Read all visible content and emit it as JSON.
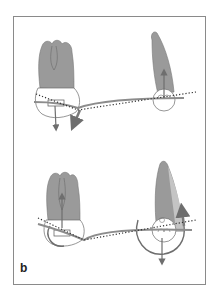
{
  "figure": {
    "panel_label": "b",
    "colors": {
      "tooth": "#9a9a9a",
      "tooth_light": "#c4c4c4",
      "outline": "#6a6a6a",
      "arrow": "#7a7a7a",
      "wire": "#8c8c8c",
      "dotted": "#333333",
      "frame": "#8a8a8a"
    },
    "top_panel": {
      "description": "Molar and canine with archwire, force arrows and dotted reference line",
      "left_tooth": "molar",
      "right_tooth": "canine",
      "arrows": [
        "molar-downward-force",
        "wire-extension",
        "canine-upward-force"
      ]
    },
    "bottom_panel": {
      "description": "Molar and canine with rotational moments shown as arcs",
      "left_tooth": "molar",
      "right_tooth": "canine",
      "arrows": [
        "molar-upward-force",
        "canine-downward-force",
        "canine-moment-arc",
        "molar-moment-arc"
      ]
    }
  }
}
